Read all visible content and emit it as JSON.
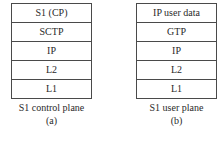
{
  "diagrams": [
    {
      "layers": [
        "S1 (CP)",
        "SCTP",
        "IP",
        "L2",
        "L1"
      ],
      "title": "S1 control plane",
      "label": "(a)"
    },
    {
      "layers": [
        "IP user data",
        "GTP",
        "IP",
        "L2",
        "L1"
      ],
      "title": "S1 user plane",
      "label": "(b)"
    }
  ]
}
